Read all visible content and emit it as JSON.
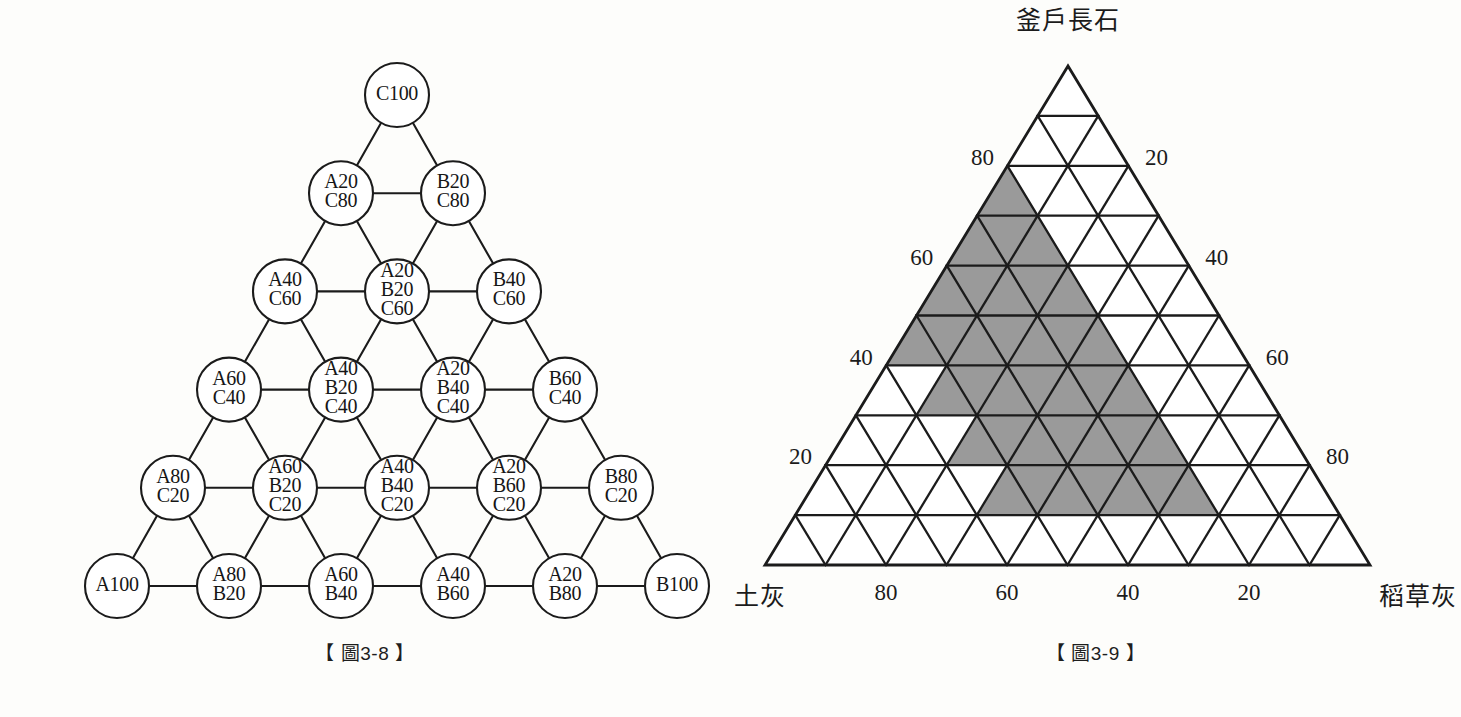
{
  "figures": [
    {
      "id": "fig-3-8",
      "caption": "【 圖3-8 】",
      "type": "triangular-blend-node-diagram",
      "description": "Triangular lattice of blend compositions from A100/B100/C100 corners in 20% steps",
      "rows": [
        {
          "row": 0,
          "nodes": [
            {
              "lines": [
                "C100"
              ]
            }
          ]
        },
        {
          "row": 1,
          "nodes": [
            {
              "lines": [
                "A20",
                "C80"
              ]
            },
            {
              "lines": [
                "B20",
                "C80"
              ]
            }
          ]
        },
        {
          "row": 2,
          "nodes": [
            {
              "lines": [
                "A40",
                "C60"
              ]
            },
            {
              "lines": [
                "A20",
                "B20",
                "C60"
              ]
            },
            {
              "lines": [
                "B40",
                "C60"
              ]
            }
          ]
        },
        {
          "row": 3,
          "nodes": [
            {
              "lines": [
                "A60",
                "C40"
              ]
            },
            {
              "lines": [
                "A40",
                "B20",
                "C40"
              ]
            },
            {
              "lines": [
                "A20",
                "B40",
                "C40"
              ]
            },
            {
              "lines": [
                "B60",
                "C40"
              ]
            }
          ]
        },
        {
          "row": 4,
          "nodes": [
            {
              "lines": [
                "A80",
                "C20"
              ]
            },
            {
              "lines": [
                "A60",
                "B20",
                "C20"
              ]
            },
            {
              "lines": [
                "A40",
                "B40",
                "C20"
              ]
            },
            {
              "lines": [
                "A20",
                "B60",
                "C20"
              ]
            },
            {
              "lines": [
                "B80",
                "C20"
              ]
            }
          ]
        },
        {
          "row": 5,
          "nodes": [
            {
              "lines": [
                "A100"
              ]
            },
            {
              "lines": [
                "A80",
                "B20"
              ]
            },
            {
              "lines": [
                "A60",
                "B40"
              ]
            },
            {
              "lines": [
                "A40",
                "B60"
              ]
            },
            {
              "lines": [
                "A20",
                "B80"
              ]
            },
            {
              "lines": [
                "B100"
              ]
            }
          ]
        }
      ]
    },
    {
      "id": "fig-3-9",
      "caption": "【 圖3-9 】",
      "type": "ternary-grid-diagram",
      "vertices": {
        "top": "釜戶長石",
        "bottom_left": "土灰",
        "bottom_right": "稻草灰"
      },
      "axes": {
        "left_ticks": [
          "80",
          "60",
          "40",
          "20"
        ],
        "right_ticks": [
          "20",
          "40",
          "60",
          "80"
        ],
        "bottom_ticks": [
          "80",
          "60",
          "40",
          "20"
        ]
      },
      "grid_divisions": 10,
      "shaded_color": "#9a9a9a",
      "shaded_region_note": "Rhombus-shaped shaded band of small triangles spanning mid composition range"
    }
  ],
  "chart_data": [
    {
      "type": "table",
      "title": "【 圖3-8 】",
      "xlabel": "",
      "ylabel": "",
      "categories": [
        "row0",
        "row1",
        "row2",
        "row3",
        "row4",
        "row5"
      ],
      "values": [
        1,
        2,
        3,
        4,
        5,
        6
      ],
      "series": [
        {
          "name": "row0",
          "values": [
            "C100"
          ]
        },
        {
          "name": "row1",
          "values": [
            "A20 C80",
            "B20 C80"
          ]
        },
        {
          "name": "row2",
          "values": [
            "A40 C60",
            "A20 B20 C60",
            "B40 C60"
          ]
        },
        {
          "name": "row3",
          "values": [
            "A60 C40",
            "A40 B20 C40",
            "A20 B40 C40",
            "B60 C40"
          ]
        },
        {
          "name": "row4",
          "values": [
            "A80 C20",
            "A60 B20 C20",
            "A40 B40 C20",
            "A20 B60 C20",
            "B80 C20"
          ]
        },
        {
          "name": "row5",
          "values": [
            "A100",
            "A80 B20",
            "A60 B40",
            "A40 B60",
            "A20 B80",
            "B100"
          ]
        }
      ]
    },
    {
      "type": "heatmap",
      "title": "【 圖3-9 】",
      "xlabel": "土灰 — 稻草灰",
      "ylabel": "釜戶長石",
      "categories": [
        "釜戶長石",
        "土灰",
        "稻草灰"
      ],
      "values": [
        100,
        100,
        100
      ],
      "axis_ranges": {
        "left": [
          20,
          80
        ],
        "right": [
          20,
          80
        ],
        "bottom": [
          20,
          80
        ]
      },
      "grid": true,
      "legend": "none"
    }
  ]
}
